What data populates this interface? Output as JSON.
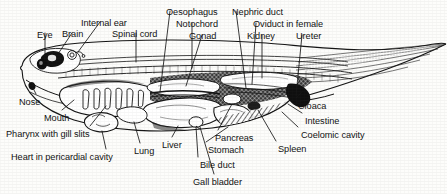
{
  "figure": {
    "style": "black-and-white scanned line drawing with stipple and hatch shading",
    "ink_color": "#141414",
    "background_color": "#fdfdfb"
  },
  "labels": [
    {
      "id": "eye",
      "text": "Eye",
      "x": 37,
      "y": 30,
      "anchor": "start"
    },
    {
      "id": "brain",
      "text": "Brain",
      "x": 62,
      "y": 29,
      "anchor": "start"
    },
    {
      "id": "internal-ear",
      "text": "Internal ear",
      "x": 81,
      "y": 18,
      "anchor": "start"
    },
    {
      "id": "spinal-cord",
      "text": "Spinal cord",
      "x": 112,
      "y": 29,
      "anchor": "start"
    },
    {
      "id": "oesophagus",
      "text": "Oesophagus",
      "x": 166,
      "y": 7,
      "anchor": "start"
    },
    {
      "id": "notochord",
      "text": "Notochord",
      "x": 176,
      "y": 19,
      "anchor": "start"
    },
    {
      "id": "gonad",
      "text": "Gonad",
      "x": 189,
      "y": 31,
      "anchor": "start"
    },
    {
      "id": "nephric-duct",
      "text": "Nephric duct",
      "x": 232,
      "y": 7,
      "anchor": "start"
    },
    {
      "id": "oviduct",
      "text": "Oviduct in female",
      "x": 253,
      "y": 19,
      "anchor": "start"
    },
    {
      "id": "kidney",
      "text": "Kidney",
      "x": 247,
      "y": 31,
      "anchor": "start"
    },
    {
      "id": "ureter",
      "text": "Ureter",
      "x": 296,
      "y": 31,
      "anchor": "start"
    },
    {
      "id": "nose",
      "text": "Nose",
      "x": 19,
      "y": 97,
      "anchor": "start"
    },
    {
      "id": "mouth",
      "text": "Mouth",
      "x": 44,
      "y": 113,
      "anchor": "start"
    },
    {
      "id": "pharynx",
      "text": "Pharynx with gill slits",
      "x": 6,
      "y": 129,
      "anchor": "start"
    },
    {
      "id": "heart",
      "text": "Heart in pericardial cavity",
      "x": 11,
      "y": 152,
      "anchor": "start"
    },
    {
      "id": "lung",
      "text": "Lung",
      "x": 134,
      "y": 146,
      "anchor": "start"
    },
    {
      "id": "liver",
      "text": "Liver",
      "x": 162,
      "y": 140,
      "anchor": "start"
    },
    {
      "id": "pancreas",
      "text": "Pancreas",
      "x": 215,
      "y": 133,
      "anchor": "start"
    },
    {
      "id": "stomach",
      "text": "Stomach",
      "x": 208,
      "y": 145,
      "anchor": "start"
    },
    {
      "id": "bile-duct",
      "text": "Bile duct",
      "x": 200,
      "y": 160,
      "anchor": "start"
    },
    {
      "id": "gall-bladder",
      "text": "Gall bladder",
      "x": 193,
      "y": 177,
      "anchor": "start"
    },
    {
      "id": "spleen",
      "text": "Spleen",
      "x": 278,
      "y": 144,
      "anchor": "start"
    },
    {
      "id": "cloaca",
      "text": "Cloaca",
      "x": 298,
      "y": 101,
      "anchor": "start"
    },
    {
      "id": "intestine",
      "text": "Intestine",
      "x": 305,
      "y": 116,
      "anchor": "start"
    },
    {
      "id": "coelomic",
      "text": "Coelomic cavity",
      "x": 301,
      "y": 130,
      "anchor": "start"
    }
  ]
}
